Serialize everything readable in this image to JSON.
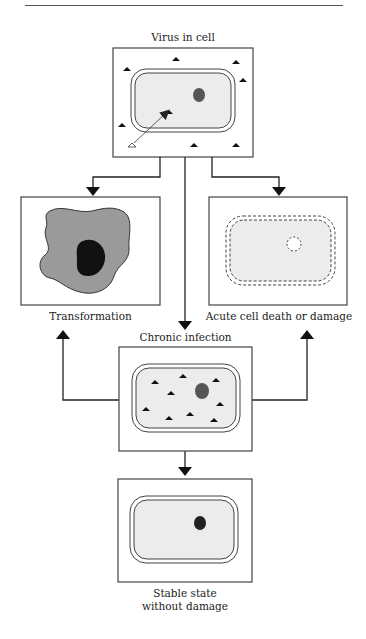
{
  "figure": {
    "top_rule": true,
    "nodes": {
      "virus_in_cell": {
        "label": "Virus in cell"
      },
      "transformation": {
        "label": "Transformation"
      },
      "acute": {
        "label": "Acute cell death or damage"
      },
      "chronic": {
        "label": "Chronic infection"
      },
      "stable": {
        "label_line1": "Stable state",
        "label_line2": "without damage"
      }
    },
    "edges": [
      {
        "from": "virus_in_cell",
        "to": "transformation"
      },
      {
        "from": "virus_in_cell",
        "to": "acute"
      },
      {
        "from": "virus_in_cell",
        "to": "chronic"
      },
      {
        "from": "chronic",
        "to": "transformation"
      },
      {
        "from": "chronic",
        "to": "acute"
      },
      {
        "from": "chronic",
        "to": "stable"
      }
    ],
    "colors": {
      "line": "#333333",
      "cytoplasm": "#ececec",
      "nucleus": "#555555",
      "transformed_cell": "#9a9a9a",
      "transformed_nucleus": "#111111",
      "virus": "#111111"
    }
  }
}
